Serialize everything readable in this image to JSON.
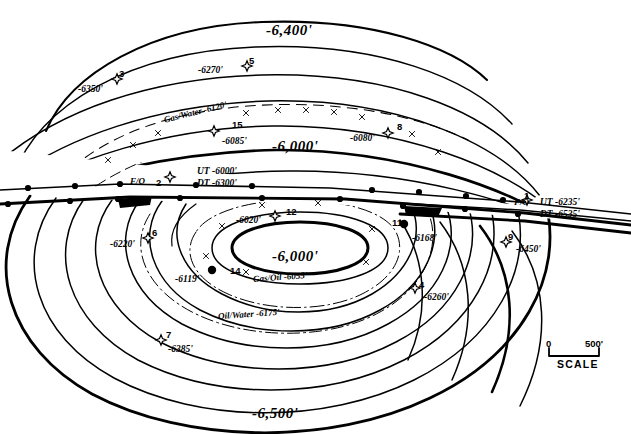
{
  "figure": {
    "kind": "structural-contour-map",
    "background_color": "#ffffff",
    "line_color": "#000000"
  },
  "contour_labels": [
    {
      "id": "c6400",
      "text": "-6,400'",
      "x": 266,
      "y": 22
    },
    {
      "id": "c6000_upper",
      "text": "-6,000'",
      "x": 272,
      "y": 138
    },
    {
      "id": "c6000_crest",
      "text": "-6,000'",
      "x": 272,
      "y": 248
    },
    {
      "id": "c6500",
      "text": "-6,500'",
      "x": 252,
      "y": 405
    }
  ],
  "fluid_contacts": [
    {
      "id": "gas-water",
      "text": "Gas/Water -6120'",
      "x": 163,
      "y": 107,
      "rotate": -14
    },
    {
      "id": "gas-oil",
      "text": "Gas/Oil -6055'",
      "x": 253,
      "y": 272,
      "rotate": -4
    },
    {
      "id": "oil-water",
      "text": "Oil/Water -6175'",
      "x": 218,
      "y": 309,
      "rotate": -4
    }
  ],
  "fault_labels": [
    {
      "id": "fo-left",
      "text": "F/O",
      "x": 130,
      "y": 176
    },
    {
      "id": "fo-right",
      "text": "F/O",
      "x": 514,
      "y": 197
    }
  ],
  "wells": [
    {
      "number": "3",
      "symbol": "star",
      "x": 117,
      "y": 79,
      "num_x": 119,
      "num_y": 68,
      "label": "-6350'",
      "lab_x": 78,
      "lab_y": 84
    },
    {
      "number": "5",
      "symbol": "star",
      "x": 247,
      "y": 66,
      "num_x": 249,
      "num_y": 55,
      "label": "-6270'",
      "lab_x": 198,
      "lab_y": 65
    },
    {
      "number": "15",
      "symbol": "star",
      "x": 214,
      "y": 131,
      "num_x": 232,
      "num_y": 119,
      "label": "-6085'",
      "lab_x": 222,
      "lab_y": 136
    },
    {
      "number": "8",
      "symbol": "star",
      "x": 388,
      "y": 133,
      "num_x": 397,
      "num_y": 121,
      "label": "-6080'",
      "lab_x": 350,
      "lab_y": 133
    },
    {
      "number": "2",
      "symbol": "star",
      "x": 170,
      "y": 177,
      "num_x": 156,
      "num_y": 177,
      "label": "UT -6000'",
      "lab_x": 197,
      "lab_y": 166
    },
    {
      "number": "2b",
      "symbol": "none",
      "x": 0,
      "y": 0,
      "num_x": 0,
      "num_y": 0,
      "label": "DT -6300'",
      "lab_x": 197,
      "lab_y": 178
    },
    {
      "number": "1",
      "symbol": "star",
      "x": 527,
      "y": 200,
      "num_x": 524,
      "num_y": 190,
      "label": "UT -6235'",
      "lab_x": 540,
      "lab_y": 197
    },
    {
      "number": "1b",
      "symbol": "none",
      "x": 0,
      "y": 0,
      "num_x": 0,
      "num_y": 0,
      "label": "DT -6535'",
      "lab_x": 540,
      "lab_y": 209
    },
    {
      "number": "12",
      "symbol": "star",
      "x": 275,
      "y": 216,
      "num_x": 286,
      "num_y": 206,
      "label": "-6020'",
      "lab_x": 236,
      "lab_y": 215
    },
    {
      "number": "11",
      "symbol": "filled",
      "x": 404,
      "y": 224,
      "num_x": 392,
      "num_y": 217,
      "label": "-6168'",
      "lab_x": 412,
      "lab_y": 233
    },
    {
      "number": "6",
      "symbol": "star",
      "x": 148,
      "y": 238,
      "num_x": 152,
      "num_y": 227,
      "label": "-6220'",
      "lab_x": 110,
      "lab_y": 239
    },
    {
      "number": "14",
      "symbol": "filled",
      "x": 212,
      "y": 270,
      "num_x": 230,
      "num_y": 265,
      "label": "-6119'",
      "lab_x": 175,
      "lab_y": 274
    },
    {
      "number": "9",
      "symbol": "star",
      "x": 506,
      "y": 242,
      "num_x": 508,
      "num_y": 231,
      "label": "-6450'",
      "lab_x": 516,
      "lab_y": 244
    },
    {
      "number": "4",
      "symbol": "star",
      "x": 415,
      "y": 288,
      "num_x": 419,
      "num_y": 279,
      "label": "-6260'",
      "lab_x": 424,
      "lab_y": 292
    },
    {
      "number": "7",
      "symbol": "star",
      "x": 161,
      "y": 340,
      "num_x": 166,
      "num_y": 329,
      "label": "-6385'",
      "lab_x": 168,
      "lab_y": 344
    }
  ],
  "scale_bar": {
    "zero_label": "0",
    "max_label": "500'",
    "caption": "SCALE",
    "x": 549,
    "y": 340,
    "width": 50
  }
}
